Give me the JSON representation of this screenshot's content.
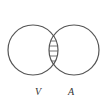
{
  "diagram": {
    "type": "venn",
    "sets": [
      {
        "label": "V",
        "cx": 33,
        "cy": 50,
        "r": 25
      },
      {
        "label": "A",
        "cx": 74,
        "cy": 50,
        "r": 25
      }
    ],
    "intersection": {
      "fill": "horizontal-hatch"
    },
    "colors": {
      "stroke": "#555555",
      "hatch": "#666666",
      "background": "#ffffff"
    }
  }
}
